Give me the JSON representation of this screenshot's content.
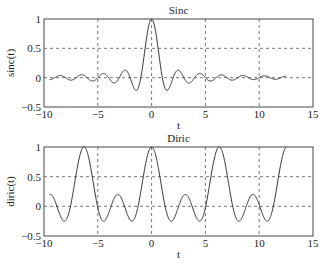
{
  "chart_data": [
    {
      "type": "line",
      "title": "Sinc",
      "xlabel": "t",
      "ylabel": "sinc(t)",
      "xlim": [
        -10,
        15
      ],
      "ylim": [
        -0.5,
        1
      ],
      "xticks": [
        -10,
        -5,
        0,
        5,
        10,
        15
      ],
      "yticks": [
        -0.5,
        0,
        0.5,
        1
      ],
      "xtick_labels": [
        "−10",
        "−5",
        "0",
        "5",
        "10",
        "15"
      ],
      "ytick_labels": [
        "−0.5",
        "0",
        "0.5",
        "1"
      ],
      "grid": true,
      "function": "sinc(t) = sin(pi t)/(pi t)",
      "t_range": [
        -9.5,
        12.5
      ],
      "series": [
        {
          "name": "sinc(t)",
          "x_start": -9.5,
          "x_end": 12.5
        }
      ]
    },
    {
      "type": "line",
      "title": "Diric",
      "xlabel": "t",
      "ylabel": "diric(t)",
      "xlim": [
        -10,
        15
      ],
      "ylim": [
        -0.5,
        1
      ],
      "xticks": [
        -10,
        -5,
        0,
        5,
        10,
        15
      ],
      "yticks": [
        -0.5,
        0,
        0.5,
        1
      ],
      "xtick_labels": [
        "−10",
        "−5",
        "0",
        "5",
        "10",
        "15"
      ],
      "ytick_labels": [
        "−0.5",
        "0",
        "0.5",
        "1"
      ],
      "grid": true,
      "function": "diric(t, 5)",
      "n": 5,
      "t_range": [
        -9.5,
        12.5
      ],
      "series": [
        {
          "name": "diric(t)",
          "x_start": -9.5,
          "x_end": 12.5
        }
      ]
    }
  ]
}
